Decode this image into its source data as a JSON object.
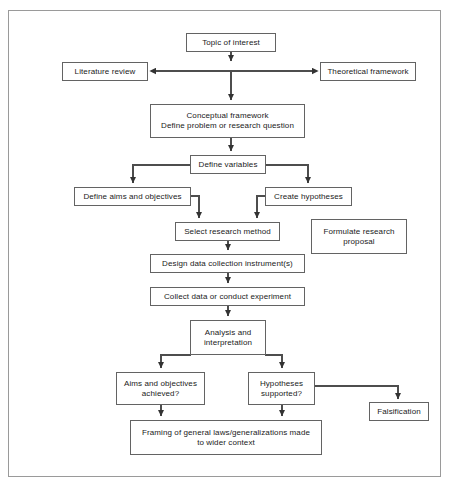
{
  "diagram": {
    "border_color": "#9a9a9a",
    "box_border_color": "#636363",
    "line_color": "#4d4d4d",
    "background": "#ffffff",
    "nodes": [
      {
        "id": "topic",
        "label": "Topic of interest"
      },
      {
        "id": "literature",
        "label": "Literature review"
      },
      {
        "id": "theoretical",
        "label": "Theoretical framework"
      },
      {
        "id": "conceptual",
        "label": "Conceptual framework\nDefine problem or research question"
      },
      {
        "id": "variables",
        "label": "Define variables"
      },
      {
        "id": "aims",
        "label": "Define aims and objectives"
      },
      {
        "id": "hypotheses",
        "label": "Create hypotheses"
      },
      {
        "id": "method",
        "label": "Select research method"
      },
      {
        "id": "proposal",
        "label": "Formulate research\nproposal"
      },
      {
        "id": "instrument",
        "label": "Design data collection instrument(s)"
      },
      {
        "id": "collect",
        "label": "Collect data or conduct experiment"
      },
      {
        "id": "analysis",
        "label": "Analysis and\ninterpretation"
      },
      {
        "id": "aims_check",
        "label": "Aims and objectives\nachieved?"
      },
      {
        "id": "hyp_check",
        "label": "Hypotheses\nsupported?"
      },
      {
        "id": "falsification",
        "label": "Falsification"
      },
      {
        "id": "framing",
        "label": "Framing of general laws/generalizations made\nto wider context"
      }
    ],
    "edges": [
      {
        "from": "topic",
        "to": "literature",
        "style": "split-horizontal-left"
      },
      {
        "from": "topic",
        "to": "theoretical",
        "style": "split-horizontal-right"
      },
      {
        "from": "topic",
        "to": "conceptual",
        "style": "vertical"
      },
      {
        "from": "conceptual",
        "to": "variables",
        "style": "vertical"
      },
      {
        "from": "variables",
        "to": "aims",
        "style": "branch-left"
      },
      {
        "from": "variables",
        "to": "hypotheses",
        "style": "branch-right"
      },
      {
        "from": "aims",
        "to": "method",
        "style": "elbow-right-down"
      },
      {
        "from": "hypotheses",
        "to": "method",
        "style": "elbow-left-down"
      },
      {
        "from": "method",
        "to": "instrument",
        "style": "vertical"
      },
      {
        "from": "instrument",
        "to": "collect",
        "style": "vertical"
      },
      {
        "from": "collect",
        "to": "analysis",
        "style": "vertical"
      },
      {
        "from": "analysis",
        "to": "aims_check",
        "style": "branch-left"
      },
      {
        "from": "analysis",
        "to": "hyp_check",
        "style": "branch-right"
      },
      {
        "from": "hyp_check",
        "to": "falsification",
        "style": "elbow-right-down"
      },
      {
        "from": "aims_check",
        "to": "framing",
        "style": "vertical"
      },
      {
        "from": "hyp_check",
        "to": "framing",
        "style": "vertical"
      }
    ]
  }
}
